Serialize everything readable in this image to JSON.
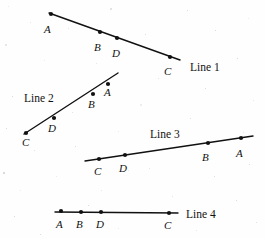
{
  "figure": {
    "background_color": "#fefefe",
    "stroke_color": "#111111",
    "point_color": "#111111"
  },
  "chart_data": {
    "type": "scatter",
    "xlabel": "",
    "ylabel": "",
    "xlim": [
      0,
      265
    ],
    "ylim": [
      239,
      0
    ],
    "grid": false,
    "legend": "none",
    "note": "Each series is a straight line segment bearing four marked points labeled A, B, C, D in differing orders along the line.",
    "series": [
      {
        "name": "Line 1",
        "label": "Line 1",
        "label_position": [
          190,
          62
        ],
        "segment_start": [
          49,
          13
        ],
        "segment_end": [
          180,
          60
        ],
        "point_order_left_to_right": [
          "A",
          "B",
          "D",
          "C"
        ],
        "points": [
          {
            "id": "A",
            "x": 51,
            "y": 14,
            "label_x": 44,
            "label_y": 24
          },
          {
            "id": "B",
            "x": 100,
            "y": 32,
            "label_x": 94,
            "label_y": 42
          },
          {
            "id": "D",
            "x": 117,
            "y": 38,
            "label_x": 112,
            "label_y": 48
          },
          {
            "id": "C",
            "x": 170,
            "y": 57,
            "label_x": 164,
            "label_y": 66
          }
        ]
      },
      {
        "name": "Line 2",
        "label": "Line 2",
        "label_position": [
          24,
          93
        ],
        "segment_start": [
          24,
          134
        ],
        "segment_end": [
          118,
          73
        ],
        "point_order_bottom_to_top": [
          "C",
          "D",
          "B",
          "A"
        ],
        "points": [
          {
            "id": "C",
            "x": 26,
            "y": 133,
            "label_x": 22,
            "label_y": 137
          },
          {
            "id": "D",
            "x": 54,
            "y": 118,
            "label_x": 48,
            "label_y": 123
          },
          {
            "id": "B",
            "x": 93,
            "y": 94,
            "label_x": 88,
            "label_y": 99
          },
          {
            "id": "A",
            "x": 108,
            "y": 84,
            "label_x": 104,
            "label_y": 87
          }
        ]
      },
      {
        "name": "Line 3",
        "label": "Line 3",
        "label_position": [
          150,
          129
        ],
        "segment_start": [
          85,
          161
        ],
        "segment_end": [
          253,
          136
        ],
        "point_order_left_to_right": [
          "C",
          "D",
          "B",
          "A"
        ],
        "points": [
          {
            "id": "C",
            "x": 99,
            "y": 159,
            "label_x": 94,
            "label_y": 166
          },
          {
            "id": "D",
            "x": 125,
            "y": 155,
            "label_x": 119,
            "label_y": 163
          },
          {
            "id": "B",
            "x": 208,
            "y": 143,
            "label_x": 202,
            "label_y": 152
          },
          {
            "id": "A",
            "x": 241,
            "y": 138,
            "label_x": 236,
            "label_y": 148
          }
        ]
      },
      {
        "name": "Line 4",
        "label": "Line 4",
        "label_position": [
          186,
          209
        ],
        "segment_start": [
          55,
          212
        ],
        "segment_end": [
          178,
          213
        ],
        "point_order_left_to_right": [
          "A",
          "B",
          "D",
          "C"
        ],
        "points": [
          {
            "id": "A",
            "x": 61,
            "y": 211,
            "label_x": 56,
            "label_y": 219
          },
          {
            "id": "B",
            "x": 81,
            "y": 212,
            "label_x": 76,
            "label_y": 219
          },
          {
            "id": "D",
            "x": 101,
            "y": 212,
            "label_x": 96,
            "label_y": 219
          },
          {
            "id": "C",
            "x": 169,
            "y": 213,
            "label_x": 164,
            "label_y": 220
          }
        ]
      }
    ]
  },
  "specks": [
    {
      "x": 8,
      "y": 6,
      "size": 1
    },
    {
      "x": 30,
      "y": 22,
      "size": 1
    },
    {
      "x": 110,
      "y": 8,
      "size": 2
    },
    {
      "x": 187,
      "y": 10,
      "size": 1
    },
    {
      "x": 215,
      "y": 30,
      "size": 1
    },
    {
      "x": 248,
      "y": 18,
      "size": 1
    },
    {
      "x": 5,
      "y": 44,
      "size": 2
    },
    {
      "x": 68,
      "y": 28,
      "size": 1
    },
    {
      "x": 145,
      "y": 34,
      "size": 1
    },
    {
      "x": 237,
      "y": 58,
      "size": 1
    },
    {
      "x": 44,
      "y": 60,
      "size": 1
    },
    {
      "x": 96,
      "y": 63,
      "size": 1
    },
    {
      "x": 158,
      "y": 78,
      "size": 1
    },
    {
      "x": 205,
      "y": 88,
      "size": 1
    },
    {
      "x": 12,
      "y": 96,
      "size": 1
    },
    {
      "x": 140,
      "y": 104,
      "size": 2
    },
    {
      "x": 253,
      "y": 100,
      "size": 1
    },
    {
      "x": 72,
      "y": 112,
      "size": 1
    },
    {
      "x": 190,
      "y": 118,
      "size": 1
    },
    {
      "x": 6,
      "y": 128,
      "size": 1
    },
    {
      "x": 118,
      "y": 131,
      "size": 1
    },
    {
      "x": 243,
      "y": 132,
      "size": 1
    },
    {
      "x": 34,
      "y": 150,
      "size": 1
    },
    {
      "x": 75,
      "y": 146,
      "size": 1
    },
    {
      "x": 3,
      "y": 172,
      "size": 2
    },
    {
      "x": 56,
      "y": 176,
      "size": 1
    },
    {
      "x": 128,
      "y": 170,
      "size": 1
    },
    {
      "x": 149,
      "y": 168,
      "size": 1
    },
    {
      "x": 214,
      "y": 176,
      "size": 1
    },
    {
      "x": 249,
      "y": 164,
      "size": 1
    },
    {
      "x": 20,
      "y": 190,
      "size": 1
    },
    {
      "x": 101,
      "y": 190,
      "size": 1
    },
    {
      "x": 172,
      "y": 196,
      "size": 1
    },
    {
      "x": 236,
      "y": 200,
      "size": 1
    },
    {
      "x": 14,
      "y": 216,
      "size": 1
    },
    {
      "x": 118,
      "y": 228,
      "size": 1
    },
    {
      "x": 196,
      "y": 230,
      "size": 1
    },
    {
      "x": 256,
      "y": 222,
      "size": 1
    },
    {
      "x": 40,
      "y": 234,
      "size": 1
    },
    {
      "x": 88,
      "y": 205,
      "size": 1
    }
  ]
}
